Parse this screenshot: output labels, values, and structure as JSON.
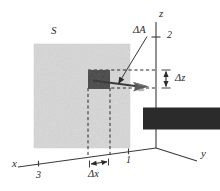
{
  "figure": {
    "type": "physics-vector-diagram",
    "background_color": "#ffffff",
    "ink_color": "#2b2b2b"
  },
  "axes": {
    "x": {
      "label": "x",
      "ticks": [
        "3",
        "1"
      ]
    },
    "y": {
      "label": "y",
      "ticks": []
    },
    "z": {
      "label": "z",
      "ticks": [
        "2"
      ]
    }
  },
  "labels": {
    "surface": "S",
    "area_vector_delta": "Δ",
    "area_vector_symbol": "A",
    "delta_z": "Δz",
    "delta_x": "Δx"
  },
  "ticks": {
    "x_three": "3",
    "x_one": "1",
    "z_two": "2"
  },
  "colors": {
    "surface_fill": "#cfcfcf",
    "patch_fill": "#4a4a4a",
    "axis": "#3a3a3a",
    "dashed": "#2b2b2b",
    "vector": "#3c3c3c"
  }
}
